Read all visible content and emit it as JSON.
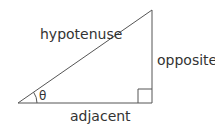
{
  "diagram": {
    "labels": {
      "hypotenuse": "hypotenuse",
      "opposite": "opposite",
      "adjacent": "adjacent",
      "angle": "θ"
    },
    "colors": {
      "line": "#555555",
      "text": "#333333",
      "background": "#ffffff"
    }
  }
}
